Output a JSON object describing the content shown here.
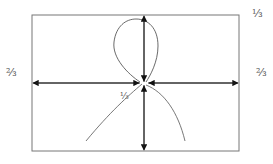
{
  "diagram": {
    "type": "force-diagram",
    "frame": {
      "x": 32,
      "y": 15,
      "width": 207,
      "height": 136
    },
    "center": {
      "x": 144,
      "y": 83
    },
    "labels": {
      "top_right": "⅓",
      "left": "⅔",
      "right": "⅔",
      "center": "⅓"
    },
    "caption": "",
    "colors": {
      "stroke": "#222222",
      "frame": "#777777",
      "label": "#555555"
    }
  }
}
